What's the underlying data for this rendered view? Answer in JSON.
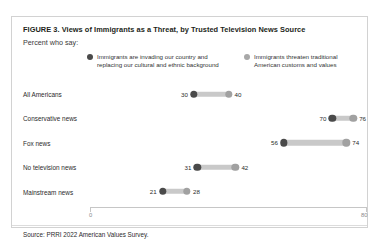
{
  "figure": {
    "title": "FIGURE 3.  Views of Immigrants as a Threat, by Trusted Television News Source",
    "subtitle": "Percent who say:",
    "source": "Source: PRRI 2022 American Values Survey."
  },
  "colors": {
    "series_dark": "#4a4a4a",
    "series_light": "#a1a1a1",
    "connector": "#c9c9c9",
    "border": "#d2d2d2",
    "axis": "#c6c6c6"
  },
  "chart_data": {
    "type": "bar",
    "subtype": "dumbbell",
    "title": "FIGURE 3.  Views of Immigrants as a Threat, by Trusted Television News Source",
    "subtitle": "Percent who say:",
    "xlabel": "",
    "ylabel": "",
    "xlim": [
      0,
      80
    ],
    "x_ticks": [
      0,
      80
    ],
    "x_tick_labels": [
      "0",
      "80"
    ],
    "grid": false,
    "legend_position": "top",
    "categories": [
      "All Americans",
      "Conservative news",
      "Fox news",
      "No television news",
      "Mainstream news"
    ],
    "series": [
      {
        "name": "Immigrants are invading our country and replacing our cultural and ethnic background",
        "color": "#4a4a4a",
        "values": [
          30,
          70,
          56,
          31,
          21
        ]
      },
      {
        "name": "Immigrants threaten traditional American customs and values",
        "color": "#a1a1a1",
        "values": [
          40,
          76,
          74,
          42,
          28
        ]
      }
    ]
  },
  "legend": [
    {
      "line1": "Immigrants are invading our country and",
      "line2": "replacing our cultural and ethnic background",
      "swatch": "legend-dot-dark"
    },
    {
      "line1": "Immigrants threaten traditional",
      "line2": "American customs  and values",
      "swatch": "legend-dot-light"
    }
  ],
  "axis": {
    "min_label": "0",
    "max_label": "80"
  }
}
